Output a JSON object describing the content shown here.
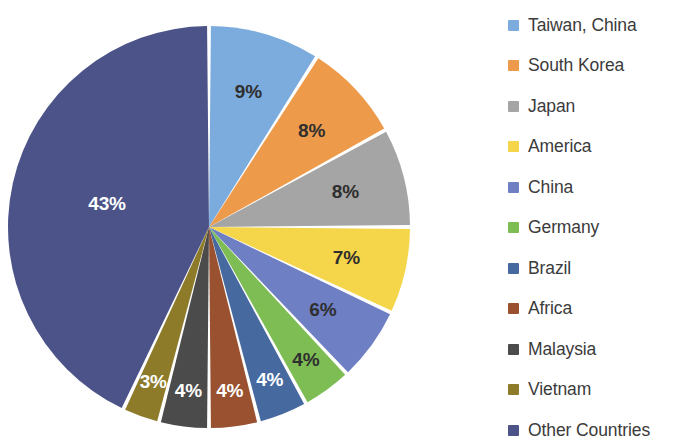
{
  "chart_data": {
    "type": "pie",
    "title": "",
    "subtitle": "",
    "xlabel": "",
    "ylabel": "",
    "legend_position": "right",
    "grid": false,
    "start_angle_deg": 0,
    "direction": "clockwise",
    "categories": [
      "Taiwan, China",
      "South Korea",
      "Japan",
      "America",
      "China",
      "Germany",
      "Brazil",
      "Africa",
      "Malaysia",
      "Vietnam",
      "Other Countries"
    ],
    "values": [
      9,
      8,
      8,
      7,
      6,
      4,
      4,
      4,
      4,
      3,
      43
    ],
    "data_labels": [
      "9%",
      "8%",
      "8%",
      "7%",
      "6%",
      "4%",
      "4%",
      "4%",
      "4%",
      "3%",
      "43%"
    ],
    "colors": [
      "#7cabdd",
      "#ed9b4b",
      "#a5a5a5",
      "#f5d64a",
      "#6e7fc4",
      "#7dbd54",
      "#46699f",
      "#9a5130",
      "#4b4b4b",
      "#8d7b2a",
      "#4b5388"
    ],
    "label_text_colors": [
      "#2f2f2f",
      "#2f2f2f",
      "#2f2f2f",
      "#2f2f2f",
      "#2f2f2f",
      "#2f2f2f",
      "#ffffff",
      "#ffffff",
      "#ffffff",
      "#ffffff",
      "#ffffff"
    ],
    "slice_gap": true,
    "total": 100
  },
  "legend": {
    "items": [
      {
        "label": "Taiwan, China",
        "color": "#7cabdd"
      },
      {
        "label": "South Korea",
        "color": "#ed9b4b"
      },
      {
        "label": "Japan",
        "color": "#a5a5a5"
      },
      {
        "label": "America",
        "color": "#f5d64a"
      },
      {
        "label": "China",
        "color": "#6e7fc4"
      },
      {
        "label": "Germany",
        "color": "#7dbd54"
      },
      {
        "label": "Brazil",
        "color": "#46699f"
      },
      {
        "label": "Africa",
        "color": "#9a5130"
      },
      {
        "label": "Malaysia",
        "color": "#4b4b4b"
      },
      {
        "label": "Vietnam",
        "color": "#8d7b2a"
      },
      {
        "label": "Other Countries",
        "color": "#4b5388"
      }
    ]
  },
  "pie_geometry": {
    "cx": 209,
    "cy": 227,
    "r": 201
  }
}
